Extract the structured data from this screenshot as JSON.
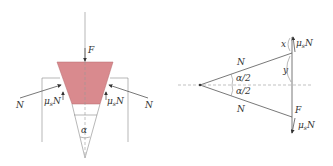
{
  "left_diagram": {
    "force_label": "F",
    "normal_left": "N",
    "normal_right": "N",
    "friction_left": "μsN",
    "friction_right": "μsN",
    "friction_left_mu": "μ",
    "friction_left_sub": "s",
    "friction_left_n": "N",
    "friction_right_mu": "μ",
    "friction_right_sub": "s",
    "friction_right_n": "N",
    "angle_label": "α",
    "wedge_color": "#d98a8e"
  },
  "right_diagram": {
    "normal_upper": "N",
    "normal_lower": "N",
    "half_angle_upper": "α/2",
    "half_angle_lower": "α/2",
    "x_label": "x",
    "y_label": "y",
    "force_label": "F",
    "friction_upper_mu": "μ",
    "friction_upper_sub": "s",
    "friction_upper_n": "N",
    "friction_lower_mu": "μ",
    "friction_lower_sub": "s",
    "friction_lower_n": "N"
  }
}
